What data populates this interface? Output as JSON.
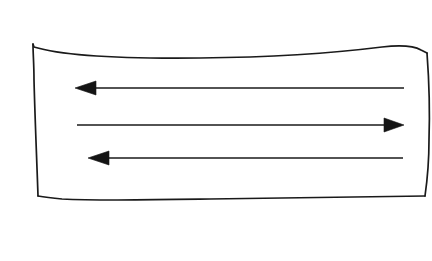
{
  "figure": {
    "background_color": "#ffffff",
    "ink_color": "#1a1a1a",
    "style": "hand-drawn sketch, pen on paper"
  },
  "chart_data": {
    "type": "diagram",
    "title": "",
    "xlabel": "",
    "ylabel": "",
    "grid": false,
    "legend": null,
    "canvas": {
      "width": 432,
      "height": 261
    },
    "shapes": [
      {
        "name": "outer-rectangle",
        "kind": "rectangle",
        "hand_drawn": true,
        "stroke_color": "#1a1a1a",
        "stroke_width": 1.6,
        "fill": "none",
        "corners": {
          "top_left": [
            33,
            46
          ],
          "top_right": [
            427,
            52
          ],
          "bottom_right": [
            425,
            196
          ],
          "bottom_left": [
            38,
            197
          ]
        },
        "edges": {
          "top": "M 33 44 L 34 47 C 60 55 110 59 200 58 C 290 57 350 51 382 47 C 400 45 414 46 421 50 L 427 53",
          "right": "M 427 53 C 429 80 430 110 429 140 C 429 165 427 182 425 196",
          "bottom": "M 425 196 C 380 197 300 198 210 199 C 150 200 100 201 62 199 C 52 198 44 197 38 196",
          "left": "M 38 196 C 37 165 35 120 34 80 C 34 64 33 54 33 44"
        }
      }
    ],
    "arrows": [
      {
        "name": "arrow-top",
        "direction": "left",
        "y": 88,
        "tail_x": 404,
        "tip_x": 75,
        "head_length": 21,
        "head_half_width": 7,
        "shaft_width": 1.5,
        "color": "#141414",
        "label": ""
      },
      {
        "name": "arrow-middle",
        "direction": "right",
        "y": 125,
        "tail_x": 77,
        "tip_x": 404,
        "head_length": 20,
        "head_half_width": 7,
        "shaft_width": 1.5,
        "color": "#141414",
        "label": ""
      },
      {
        "name": "arrow-bottom",
        "direction": "left",
        "y": 158,
        "tail_x": 403,
        "tip_x": 88,
        "head_length": 21,
        "head_half_width": 7,
        "shaft_width": 1.5,
        "color": "#141414",
        "label": ""
      }
    ],
    "annotations": [],
    "text_labels": []
  }
}
